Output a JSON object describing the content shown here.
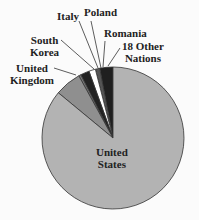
{
  "chart_data": {
    "type": "pie",
    "title": "",
    "start_angle_deg": 0,
    "direction": "counterclockwise",
    "slices": [
      {
        "label": "18 Other Nations",
        "value": 3.0,
        "color": "#1f1f1f"
      },
      {
        "label": "Romania",
        "value": 1.0,
        "color": "#555555"
      },
      {
        "label": "Poland",
        "value": 1.5,
        "color": "#ffffff"
      },
      {
        "label": "Italy",
        "value": 2.0,
        "color": "#222222"
      },
      {
        "label": "South Korea",
        "value": 0.5,
        "color": "#777777"
      },
      {
        "label": "United Kingdom",
        "value": 6.0,
        "color": "#8f8f8f"
      },
      {
        "label": "United States",
        "value": 86.0,
        "color": "#b3b3b3"
      }
    ],
    "legend": "none (direct labels with leader lines)"
  },
  "labels": {
    "italy": "Italy",
    "poland": "Poland",
    "romania": "Romania",
    "other_1": "18 Other",
    "other_2": "Nations",
    "south_korea_1": "South",
    "south_korea_2": "Korea",
    "uk_1": "United",
    "uk_2": "Kingdom",
    "us_1": "United",
    "us_2": "States"
  }
}
